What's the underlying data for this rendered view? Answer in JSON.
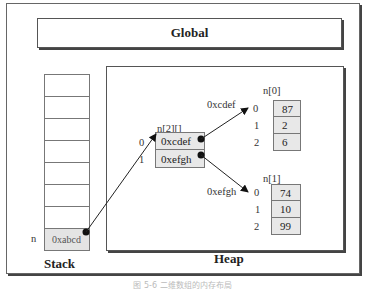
{
  "global": {
    "label": "Global"
  },
  "stack": {
    "label": "Stack",
    "empty_cells": 7,
    "var_name": "n",
    "var_value": "0xabcd"
  },
  "heap": {
    "label": "Heap",
    "pointer_array": {
      "name": "n[2][]",
      "indices": [
        "0",
        "1"
      ],
      "values": [
        "0xcdef",
        "0xefgh"
      ]
    },
    "arrays": [
      {
        "name": "n[0]",
        "address": "0xcdef",
        "indices": [
          "0",
          "1",
          "2"
        ],
        "values": [
          "87",
          "2",
          "6"
        ]
      },
      {
        "name": "n[1]",
        "address": "0xefgh",
        "indices": [
          "0",
          "1",
          "2"
        ],
        "values": [
          "74",
          "10",
          "99"
        ]
      }
    ]
  },
  "caption": "图 5-6  二维数组的内存布局"
}
